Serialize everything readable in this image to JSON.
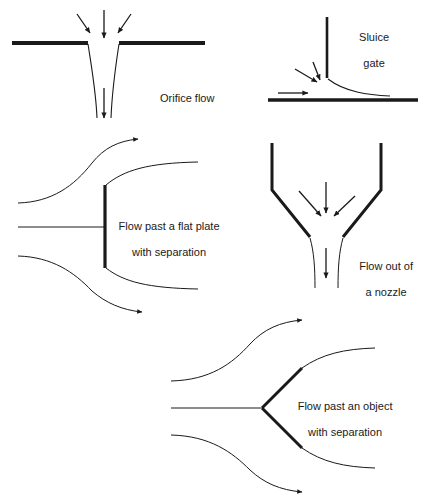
{
  "figure": {
    "background_color": "#ffffff",
    "line_color": "#1a1a1a",
    "text_color": "#1a1a1a",
    "width": 425,
    "height": 503
  },
  "panels": [
    {
      "id": "orifice",
      "label": "Orifice flow",
      "label_lines": [
        "Orifice flow"
      ],
      "label_x": 160,
      "label_y": 98,
      "align": "left",
      "description": "Flow through an orifice in a horizontal plate with vena contracta",
      "arrows_in": 3
    },
    {
      "id": "sluice-gate",
      "label": "Sluice gate",
      "label_lines": [
        "Sluice",
        "gate"
      ],
      "label_x": 370,
      "label_y": 26,
      "align": "center",
      "description": "Free surface flow passing under a vertical sluice gate",
      "arrows_in": 3
    },
    {
      "id": "flat-plate",
      "label": "Flow past a flat plate with separation",
      "label_lines": [
        "Flow past a flat plate",
        "with separation"
      ],
      "label_x": 112,
      "label_y": 212,
      "align": "left",
      "description": "Streamlines separating around a normal flat plate",
      "arrows_in": 0
    },
    {
      "id": "nozzle",
      "label": "Flow out of a nozzle",
      "label_lines": [
        "Flow out of",
        "a nozzle"
      ],
      "label_x": 350,
      "label_y": 252,
      "align": "left",
      "description": "Converging nozzle discharging a jet downward",
      "arrows_in": 3
    },
    {
      "id": "object",
      "label": "Flow past an object with separation",
      "label_lines": [
        "Flow past an object",
        "with separation"
      ],
      "label_x": 284,
      "label_y": 392,
      "align": "left",
      "description": "Streamlines separating around a wedge shaped object",
      "arrows_in": 0
    }
  ]
}
